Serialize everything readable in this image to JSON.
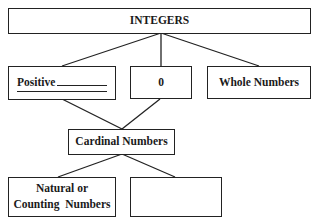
{
  "diagram": {
    "title": "INTEGERS",
    "level1": [
      {
        "label": "Positive",
        "has_blanks": true
      },
      {
        "label": "0"
      },
      {
        "label": "Whole Numbers"
      }
    ],
    "level2": {
      "label": "Cardinal Numbers"
    },
    "level3": [
      {
        "line1": "Natural or",
        "line2": "Counting  Numbers"
      },
      {
        "label": ""
      }
    ]
  }
}
